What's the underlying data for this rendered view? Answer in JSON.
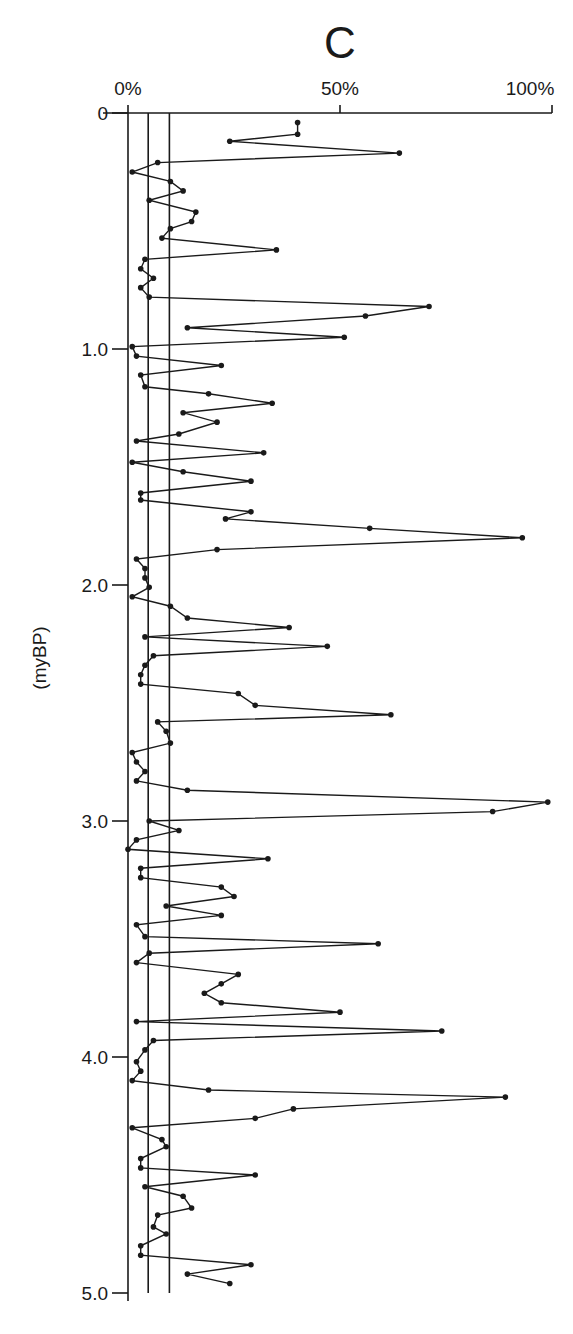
{
  "chart_data": {
    "type": "line",
    "title": "C",
    "xlabel": "",
    "ylabel": "(myBP)",
    "orientation": "vertical-depth",
    "x_axis_position": "top",
    "xlim": [
      0,
      100
    ],
    "ylim": [
      0,
      5.0
    ],
    "y_inverted": true,
    "x_ticks": [
      0,
      50,
      100
    ],
    "x_tick_labels": [
      "0%",
      "50%",
      "100%"
    ],
    "y_ticks": [
      0,
      1.0,
      2.0,
      3.0,
      4.0,
      5.0
    ],
    "y_tick_labels": [
      "0",
      "1.0",
      "2.0",
      "3.0",
      "4.0",
      "5.0"
    ],
    "reference_lines_percent": [
      0,
      5,
      10
    ],
    "grid": false,
    "legend": null,
    "markers": true,
    "series": [
      {
        "name": "C",
        "points": [
          {
            "age": 0.04,
            "pct": 40
          },
          {
            "age": 0.09,
            "pct": 40
          },
          {
            "age": 0.12,
            "pct": 24
          },
          {
            "age": 0.17,
            "pct": 64
          },
          {
            "age": 0.21,
            "pct": 7
          },
          {
            "age": 0.25,
            "pct": 1
          },
          {
            "age": 0.29,
            "pct": 10
          },
          {
            "age": 0.33,
            "pct": 13
          },
          {
            "age": 0.37,
            "pct": 5
          },
          {
            "age": 0.42,
            "pct": 16
          },
          {
            "age": 0.46,
            "pct": 15
          },
          {
            "age": 0.49,
            "pct": 10
          },
          {
            "age": 0.53,
            "pct": 8
          },
          {
            "age": 0.58,
            "pct": 35
          },
          {
            "age": 0.62,
            "pct": 4
          },
          {
            "age": 0.66,
            "pct": 3
          },
          {
            "age": 0.7,
            "pct": 6
          },
          {
            "age": 0.74,
            "pct": 3
          },
          {
            "age": 0.78,
            "pct": 5
          },
          {
            "age": 0.82,
            "pct": 71
          },
          {
            "age": 0.86,
            "pct": 56
          },
          {
            "age": 0.91,
            "pct": 14
          },
          {
            "age": 0.95,
            "pct": 51
          },
          {
            "age": 0.99,
            "pct": 1
          },
          {
            "age": 1.03,
            "pct": 2
          },
          {
            "age": 1.07,
            "pct": 22
          },
          {
            "age": 1.11,
            "pct": 3
          },
          {
            "age": 1.16,
            "pct": 4
          },
          {
            "age": 1.19,
            "pct": 19
          },
          {
            "age": 1.23,
            "pct": 34
          },
          {
            "age": 1.27,
            "pct": 13
          },
          {
            "age": 1.31,
            "pct": 21
          },
          {
            "age": 1.36,
            "pct": 12
          },
          {
            "age": 1.39,
            "pct": 2
          },
          {
            "age": 1.44,
            "pct": 32
          },
          {
            "age": 1.48,
            "pct": 1
          },
          {
            "age": 1.52,
            "pct": 13
          },
          {
            "age": 1.56,
            "pct": 29
          },
          {
            "age": 1.61,
            "pct": 3
          },
          {
            "age": 1.64,
            "pct": 3
          },
          {
            "age": 1.69,
            "pct": 29
          },
          {
            "age": 1.72,
            "pct": 23
          },
          {
            "age": 1.76,
            "pct": 57
          },
          {
            "age": 1.8,
            "pct": 93
          },
          {
            "age": 1.85,
            "pct": 21
          },
          {
            "age": 1.89,
            "pct": 2
          },
          {
            "age": 1.93,
            "pct": 4
          },
          {
            "age": 1.97,
            "pct": 4
          },
          {
            "age": 2.01,
            "pct": 5
          },
          {
            "age": 2.05,
            "pct": 1
          },
          {
            "age": 2.09,
            "pct": 10
          },
          {
            "age": 2.14,
            "pct": 14
          },
          {
            "age": 2.18,
            "pct": 38
          },
          {
            "age": 2.22,
            "pct": 4
          },
          {
            "age": 2.26,
            "pct": 47
          },
          {
            "age": 2.3,
            "pct": 6
          },
          {
            "age": 2.34,
            "pct": 4
          },
          {
            "age": 2.38,
            "pct": 3
          },
          {
            "age": 2.42,
            "pct": 3
          },
          {
            "age": 2.46,
            "pct": 26
          },
          {
            "age": 2.51,
            "pct": 30
          },
          {
            "age": 2.55,
            "pct": 62
          },
          {
            "age": 2.58,
            "pct": 7
          },
          {
            "age": 2.62,
            "pct": 9
          },
          {
            "age": 2.67,
            "pct": 10
          },
          {
            "age": 2.71,
            "pct": 1
          },
          {
            "age": 2.75,
            "pct": 2
          },
          {
            "age": 2.79,
            "pct": 4
          },
          {
            "age": 2.83,
            "pct": 2
          },
          {
            "age": 2.87,
            "pct": 14
          },
          {
            "age": 2.92,
            "pct": 99
          },
          {
            "age": 2.96,
            "pct": 86
          },
          {
            "age": 3.0,
            "pct": 5
          },
          {
            "age": 3.04,
            "pct": 12
          },
          {
            "age": 3.08,
            "pct": 2
          },
          {
            "age": 3.12,
            "pct": 0
          },
          {
            "age": 3.16,
            "pct": 33
          },
          {
            "age": 3.2,
            "pct": 3
          },
          {
            "age": 3.24,
            "pct": 3
          },
          {
            "age": 3.28,
            "pct": 22
          },
          {
            "age": 3.32,
            "pct": 25
          },
          {
            "age": 3.36,
            "pct": 9
          },
          {
            "age": 3.4,
            "pct": 22
          },
          {
            "age": 3.44,
            "pct": 2
          },
          {
            "age": 3.49,
            "pct": 4
          },
          {
            "age": 3.52,
            "pct": 59
          },
          {
            "age": 3.56,
            "pct": 5
          },
          {
            "age": 3.6,
            "pct": 2
          },
          {
            "age": 3.65,
            "pct": 26
          },
          {
            "age": 3.69,
            "pct": 22
          },
          {
            "age": 3.73,
            "pct": 18
          },
          {
            "age": 3.77,
            "pct": 22
          },
          {
            "age": 3.81,
            "pct": 50
          },
          {
            "age": 3.85,
            "pct": 2
          },
          {
            "age": 3.89,
            "pct": 74
          },
          {
            "age": 3.93,
            "pct": 6
          },
          {
            "age": 3.97,
            "pct": 4
          },
          {
            "age": 4.02,
            "pct": 2
          },
          {
            "age": 4.06,
            "pct": 3
          },
          {
            "age": 4.1,
            "pct": 1
          },
          {
            "age": 4.14,
            "pct": 19
          },
          {
            "age": 4.17,
            "pct": 89
          },
          {
            "age": 4.22,
            "pct": 39
          },
          {
            "age": 4.26,
            "pct": 30
          },
          {
            "age": 4.3,
            "pct": 1
          },
          {
            "age": 4.35,
            "pct": 8
          },
          {
            "age": 4.38,
            "pct": 9
          },
          {
            "age": 4.43,
            "pct": 3
          },
          {
            "age": 4.47,
            "pct": 3
          },
          {
            "age": 4.5,
            "pct": 30
          },
          {
            "age": 4.55,
            "pct": 4
          },
          {
            "age": 4.59,
            "pct": 13
          },
          {
            "age": 4.64,
            "pct": 15
          },
          {
            "age": 4.67,
            "pct": 7
          },
          {
            "age": 4.72,
            "pct": 6
          },
          {
            "age": 4.75,
            "pct": 9
          },
          {
            "age": 4.8,
            "pct": 3
          },
          {
            "age": 4.84,
            "pct": 3
          },
          {
            "age": 4.88,
            "pct": 29
          },
          {
            "age": 4.92,
            "pct": 14
          },
          {
            "age": 4.96,
            "pct": 24
          }
        ]
      }
    ]
  },
  "colors": {
    "background": "#ffffff",
    "ink": "#1a1a1a"
  }
}
